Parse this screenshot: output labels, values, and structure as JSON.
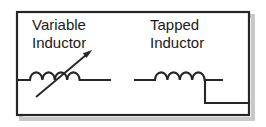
{
  "figure": {
    "background_color": "#ffffff",
    "stroke_color": "#262626",
    "shadow_color": "#c8c8c8",
    "frame": {
      "x": 17,
      "y": 12,
      "width": 232,
      "height": 103
    },
    "symbols": [
      {
        "id": "variable-inductor",
        "label_line1": "Variable",
        "label_line2": "Inductor",
        "label_x": 32,
        "label_y1": 30,
        "label_y2": 48,
        "coil_count": 4,
        "baseline_y": 80,
        "lead_start_x": 17,
        "lead_end_x": 110,
        "arrow": {
          "x1": 36,
          "y1": 97,
          "x2": 91,
          "y2": 51
        }
      },
      {
        "id": "tapped-inductor",
        "label_line1": "Tapped",
        "label_line2": "Inductor",
        "label_x": 150,
        "label_y1": 30,
        "label_y2": 48,
        "coil_count": 4,
        "baseline_y": 80,
        "lead_start_x": 135,
        "lead_end_x": 222,
        "tap": {
          "x": 205,
          "y_top": 80,
          "y_bottom": 103,
          "x_end": 249
        }
      }
    ]
  }
}
